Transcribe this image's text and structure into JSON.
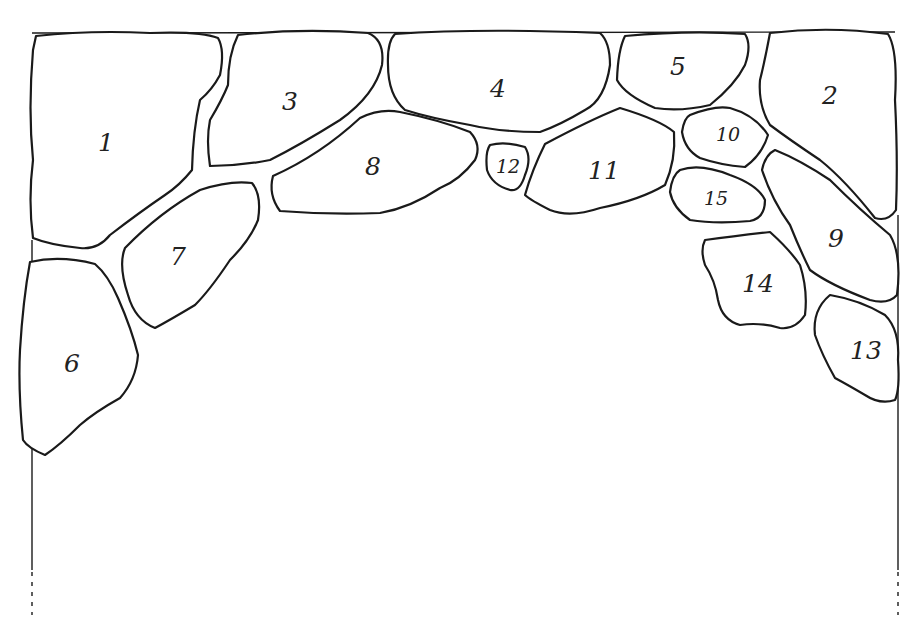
{
  "diagram": {
    "type": "stone arch layout",
    "stones": [
      {
        "id": "1",
        "label": "1"
      },
      {
        "id": "2",
        "label": "2"
      },
      {
        "id": "3",
        "label": "3"
      },
      {
        "id": "4",
        "label": "4"
      },
      {
        "id": "5",
        "label": "5"
      },
      {
        "id": "6",
        "label": "6"
      },
      {
        "id": "7",
        "label": "7"
      },
      {
        "id": "8",
        "label": "8"
      },
      {
        "id": "9",
        "label": "9"
      },
      {
        "id": "10",
        "label": "10"
      },
      {
        "id": "11",
        "label": "11"
      },
      {
        "id": "12",
        "label": "12"
      },
      {
        "id": "13",
        "label": "13"
      },
      {
        "id": "14",
        "label": "14"
      },
      {
        "id": "15",
        "label": "15"
      }
    ],
    "colors": {
      "line": "#1a1a1a",
      "background": "#ffffff"
    }
  }
}
